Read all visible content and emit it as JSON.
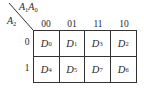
{
  "kmap": {
    "col_var_label": {
      "base1": "A",
      "sub1": "1",
      "base2": "A",
      "sub2": "0"
    },
    "row_var_label": {
      "base": "A",
      "sub": "2"
    },
    "col_headers": [
      "00",
      "01",
      "11",
      "10"
    ],
    "row_headers": [
      "0",
      "1"
    ],
    "cells": [
      [
        {
          "base": "D",
          "sub": "0"
        },
        {
          "base": "D",
          "sub": "1"
        },
        {
          "base": "D",
          "sub": "3"
        },
        {
          "base": "D",
          "sub": "2"
        }
      ],
      [
        {
          "base": "D",
          "sub": "4"
        },
        {
          "base": "D",
          "sub": "5"
        },
        {
          "base": "D",
          "sub": "7"
        },
        {
          "base": "D",
          "sub": "6"
        }
      ]
    ]
  }
}
